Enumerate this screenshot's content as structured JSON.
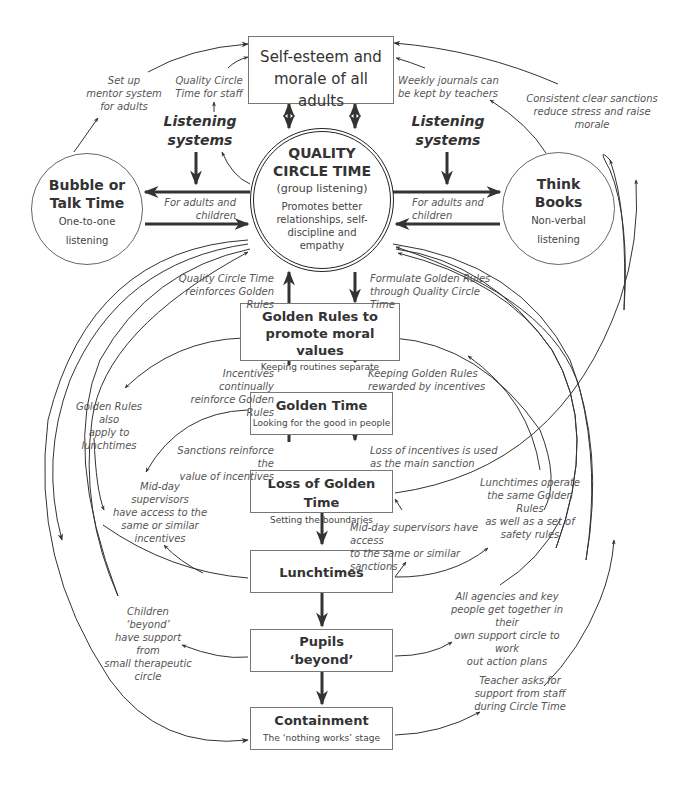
{
  "nodes": {
    "self_esteem": {
      "title": "Self-esteem and morale of all adults"
    },
    "qct": {
      "title_1": "QUALITY",
      "title_2": "CIRCLE TIME",
      "subtitle": "(group listening)",
      "body": "Promotes better relationships, self-discipline and empathy"
    },
    "bubble": {
      "title_1": "Bubble or",
      "title_2": "Talk Time",
      "sub_1": "One-to-one",
      "sub_2": "listening"
    },
    "think": {
      "title_1": "Think",
      "title_2": "Books",
      "sub_1": "Non-verbal",
      "sub_2": "listening"
    },
    "golden_rules": {
      "title_1": "Golden Rules to",
      "title_2": "promote moral values",
      "subtitle": "Keeping routines separate"
    },
    "golden_time": {
      "title": "Golden Time",
      "subtitle": "Looking for the good in people"
    },
    "loss_golden_time": {
      "title": "Loss of Golden Time",
      "subtitle": "Setting the boundaries"
    },
    "lunchtimes": {
      "title": "Lunchtimes"
    },
    "pupils_beyond": {
      "title_1": "Pupils",
      "title_2": "‘beyond’"
    },
    "containment": {
      "title": "Containment",
      "subtitle": "The ‘nothing works’ stage"
    }
  },
  "headings": {
    "listening_left_1": "Listening",
    "listening_left_2": "systems",
    "listening_right_1": "Listening",
    "listening_right_2": "systems"
  },
  "labels": {
    "mentor": [
      "Set up",
      "mentor system",
      "for adults"
    ],
    "qct_staff": [
      "Quality Circle",
      "Time for staff"
    ],
    "journals": [
      "Weekly journals can",
      "be kept by teachers"
    ],
    "sanctions_morale": [
      "Consistent clear sanctions",
      "reduce stress and raise",
      "morale"
    ],
    "adults_children_left": [
      "For adults and",
      "children"
    ],
    "adults_children_right": [
      "For adults and",
      "children"
    ],
    "qct_reinforces": [
      "Quality Circle Time",
      "reinforces Golden Rules"
    ],
    "formulate": [
      "Formulate Golden Rules",
      "through Quality Circle Time"
    ],
    "incentives_reinforce": [
      "Incentives continually",
      "reinforce Golden Rules"
    ],
    "keeping_rewarded": [
      "Keeping Golden Rules",
      "rewarded by incentives"
    ],
    "gr_lunch": [
      "Golden Rules also",
      "apply to",
      "lunchtimes"
    ],
    "sanctions_value": [
      "Sanctions reinforce the",
      "value of incentives"
    ],
    "loss_incentives": [
      "Loss of incentives is used",
      "as the main sanction"
    ],
    "midday_incentives": [
      "Mid-day supervisors",
      "have access to the",
      "same or similar",
      "incentives"
    ],
    "midday_sanctions": [
      "Mid-day supervisors have access",
      "to the same or similar sanctions"
    ],
    "lunch_operate": [
      "Lunchtimes operate",
      "the same Golden Rules",
      "as well as a set of",
      "safety rules"
    ],
    "children_beyond": [
      "Children ‘beyond’",
      "have support from",
      "small therapeutic",
      "circle"
    ],
    "agencies": [
      "All agencies and key",
      "people get together in their",
      "own support circle to work",
      "out action plans"
    ],
    "teacher_asks": [
      "Teacher asks for",
      "support from staff",
      "during Circle Time"
    ]
  },
  "colors": {
    "line": "#333333",
    "box_border": "#777777",
    "text": "#333333",
    "label": "#555555"
  }
}
